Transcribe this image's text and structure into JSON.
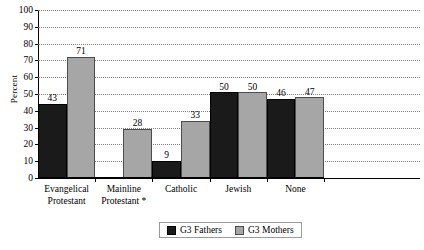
{
  "chart_data": {
    "type": "bar",
    "title": "",
    "xlabel": "",
    "ylabel": "Percent",
    "ylim": [
      0,
      100
    ],
    "ytick_step": 10,
    "yticks": [
      "100",
      "90",
      "80",
      "70",
      "60",
      "50",
      "40",
      "30",
      "20",
      "10",
      "0"
    ],
    "grid": true,
    "legend_position": "bottom",
    "categories": [
      "Evangelical Protestant",
      "Mainline Protestant *",
      "Catholic",
      "Jewish",
      "None"
    ],
    "category_lines": [
      [
        "Evangelical",
        "Protestant"
      ],
      [
        "Mainline",
        "Protestant *"
      ],
      [
        "Catholic"
      ],
      [
        "Jewish"
      ],
      [
        "None"
      ]
    ],
    "series": [
      {
        "name": "G3 Fathers",
        "color": "#1a1a1a",
        "values": [
          43,
          null,
          9,
          50,
          46
        ],
        "labels": [
          "43",
          "",
          "9",
          "50",
          "46"
        ]
      },
      {
        "name": "G3 Mothers",
        "color": "#a6a6a6",
        "values": [
          71,
          28,
          33,
          50,
          47
        ],
        "labels": [
          "71",
          "28",
          "33",
          "50",
          "47"
        ]
      }
    ]
  }
}
